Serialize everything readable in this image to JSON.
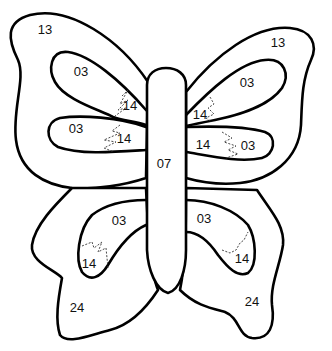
{
  "figure": {
    "colors": {
      "line": "#000000",
      "background": "#ffffff"
    }
  },
  "regions": {
    "upper_left_outer": {
      "label": "13"
    },
    "upper_right_outer": {
      "label": "13"
    },
    "upper_left_top_lobe": {
      "label": "03"
    },
    "upper_left_top_lobe_accent": {
      "label": "14"
    },
    "upper_left_bottom_lobe": {
      "label": "03"
    },
    "upper_left_bottom_lobe_accent": {
      "label": "14"
    },
    "upper_right_top_lobe": {
      "label": "03"
    },
    "upper_right_top_lobe_accent": {
      "label": "14"
    },
    "upper_right_bottom_lobe": {
      "label": "03"
    },
    "upper_right_bottom_lobe_accent": {
      "label": "14"
    },
    "body": {
      "label": "07"
    },
    "lower_left_inner": {
      "label": "03"
    },
    "lower_left_inner_accent": {
      "label": "14"
    },
    "lower_right_inner": {
      "label": "03"
    },
    "lower_right_inner_accent": {
      "label": "14"
    },
    "lower_left_outer": {
      "label": "24"
    },
    "lower_right_outer": {
      "label": "24"
    }
  }
}
